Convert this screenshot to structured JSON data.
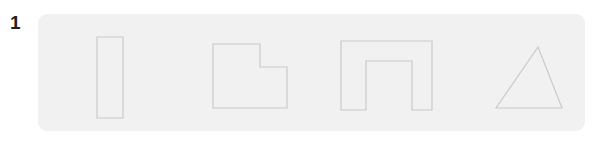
{
  "figure": {
    "item_number": "1",
    "background_color": "#ffffff",
    "panel": {
      "name": "shapes-panel",
      "fill_color": "#f1f1f1",
      "corner_radius": 9,
      "x": 38,
      "y": 14,
      "width": 547,
      "height": 117
    },
    "stroke_color": "#c9c9c9",
    "stroke_width": 1.15,
    "shape_count": 4,
    "shapes": [
      {
        "index": 1,
        "name": "tall-rectangle",
        "label": "tall rectangle",
        "type": "rect",
        "points": "59,23 85,23 85,104 59,104"
      },
      {
        "index": 2,
        "name": "notched-square",
        "label": "notched square",
        "type": "polygon",
        "points": "175,30 222,30 222,53 249,53 249,94 175,94"
      },
      {
        "index": 3,
        "name": "arch-shape",
        "label": "arch shape",
        "type": "polygon",
        "points": "303,27 394,27 394,96 374,96 374,47 328,47 328,96 303,96"
      },
      {
        "index": 4,
        "name": "triangle",
        "label": "triangle",
        "type": "polygon",
        "points": "500,33 524,94 458,94"
      }
    ]
  }
}
